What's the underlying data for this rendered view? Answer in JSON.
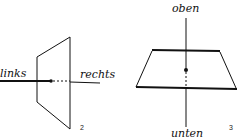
{
  "figure_2": {
    "label_left": "links",
    "label_right": "rechts",
    "number": "2"
  },
  "figure_3": {
    "label_top": "oben",
    "label_bottom": "unten",
    "number": "3"
  },
  "colors": {
    "ink": "#111111",
    "background": "#ffffff"
  }
}
